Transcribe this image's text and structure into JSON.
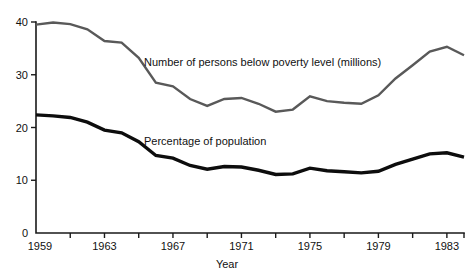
{
  "chart_data": {
    "type": "line",
    "title": "",
    "xlabel": "Year",
    "ylabel": "",
    "xlim": [
      1959,
      1984
    ],
    "ylim": [
      0,
      40
    ],
    "grid": false,
    "legend_position": "inline-annotation",
    "x_tick_labels": [
      "1959",
      "1963",
      "1967",
      "1971",
      "1975",
      "1979",
      "1983"
    ],
    "x_tick_values": [
      1959,
      1963,
      1967,
      1971,
      1975,
      1979,
      1983
    ],
    "x_minor_ticks": [
      1961,
      1965,
      1969,
      1973,
      1977,
      1981
    ],
    "y_tick_labels": [
      "0",
      "10",
      "20",
      "30",
      "40"
    ],
    "y_tick_values": [
      0,
      10,
      20,
      30,
      40
    ],
    "x": [
      1959,
      1960,
      1961,
      1962,
      1963,
      1964,
      1965,
      1966,
      1967,
      1968,
      1969,
      1970,
      1971,
      1972,
      1973,
      1974,
      1975,
      1976,
      1977,
      1978,
      1979,
      1980,
      1981,
      1982,
      1983,
      1984
    ],
    "series": [
      {
        "name": "Number of persons below poverty level (millions)",
        "color": "#595959",
        "values": [
          39.5,
          39.9,
          39.6,
          38.6,
          36.4,
          36.1,
          33.2,
          28.5,
          27.8,
          25.4,
          24.1,
          25.4,
          25.6,
          24.5,
          23.0,
          23.4,
          25.9,
          25.0,
          24.7,
          24.5,
          26.1,
          29.3,
          31.8,
          34.4,
          35.3,
          33.7
        ]
      },
      {
        "name": "Percentage of population",
        "color": "#0d0d0d",
        "values": [
          22.4,
          22.2,
          21.9,
          21.0,
          19.5,
          19.0,
          17.3,
          14.7,
          14.2,
          12.8,
          12.1,
          12.6,
          12.5,
          11.9,
          11.1,
          11.2,
          12.3,
          11.8,
          11.6,
          11.4,
          11.7,
          13.0,
          14.0,
          15.0,
          15.2,
          14.4
        ]
      }
    ],
    "annotations": [
      {
        "name": "persons-series-label",
        "text": "Number of persons below poverty level (millions)",
        "x_px": 144,
        "y_px": 66
      },
      {
        "name": "percent-series-label",
        "text": "Percentage of population",
        "x_px": 144,
        "y_px": 145
      }
    ]
  }
}
